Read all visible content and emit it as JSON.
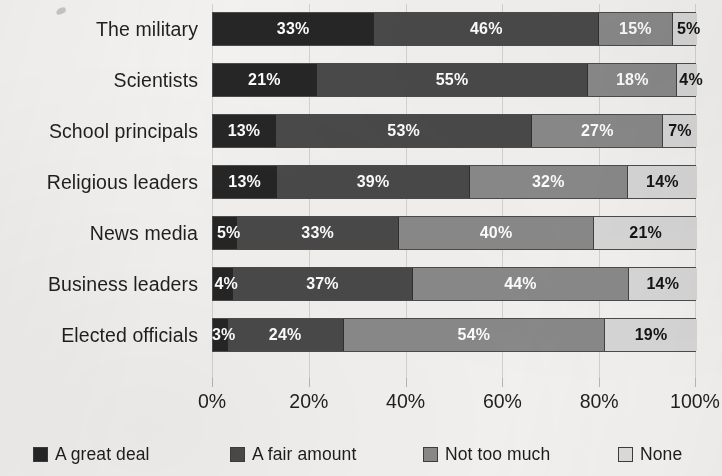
{
  "chart_data": {
    "type": "bar",
    "orientation": "horizontal",
    "stacked": true,
    "normalized_percent": true,
    "title": "",
    "subtitle": "",
    "xlabel": "",
    "ylabel": "",
    "xlim": [
      0,
      100
    ],
    "grid": true,
    "legend_position": "bottom",
    "categories": [
      "The military",
      "Scientists",
      "School principals",
      "Religious leaders",
      "News media",
      "Business leaders",
      "Elected officials"
    ],
    "series": [
      {
        "name": "A great deal",
        "color": "#262626",
        "values": [
          33,
          21,
          13,
          13,
          5,
          4,
          3
        ],
        "labels": [
          "33%",
          "21%",
          "13%",
          "13%",
          "5%",
          "4%",
          "3%"
        ]
      },
      {
        "name": "A fair amount",
        "color": "#4a4a4a",
        "values": [
          46,
          55,
          53,
          39,
          33,
          37,
          24
        ],
        "labels": [
          "46%",
          "55%",
          "53%",
          "39%",
          "33%",
          "37%",
          "24%"
        ]
      },
      {
        "name": "Not too much",
        "color": "#8a8a8a",
        "values": [
          15,
          18,
          27,
          32,
          40,
          44,
          54
        ],
        "labels": [
          "15%",
          "18%",
          "27%",
          "32%",
          "40%",
          "44%",
          "54%"
        ]
      },
      {
        "name": "None",
        "color": "#d8d8d8",
        "values": [
          5,
          4,
          7,
          14,
          21,
          14,
          19
        ],
        "labels": [
          "5%",
          "4%",
          "7%",
          "14%",
          "21%",
          "14%",
          "19%"
        ]
      }
    ],
    "xticks": [
      0,
      20,
      40,
      60,
      80,
      100
    ],
    "xticklabels": [
      "0%",
      "20%",
      "40%",
      "60%",
      "80%",
      "100%"
    ]
  },
  "axis": {
    "ticks": [
      {
        "value": 0,
        "label": "0%"
      },
      {
        "value": 20,
        "label": "20%"
      },
      {
        "value": 40,
        "label": "40%"
      },
      {
        "value": 60,
        "label": "60%"
      },
      {
        "value": 80,
        "label": "80%"
      },
      {
        "value": 100,
        "label": "100%"
      }
    ]
  },
  "legend": {
    "items": [
      {
        "label": "A great deal",
        "color": "#262626",
        "x": 33
      },
      {
        "label": "A fair amount",
        "color": "#4a4a4a",
        "x": 230
      },
      {
        "label": "Not too much",
        "color": "#8a8a8a",
        "x": 423
      },
      {
        "label": "None",
        "color": "#dedede",
        "x": 618
      }
    ]
  },
  "colors": {
    "background": "#f4f3f1",
    "bar_border": "#4c4c4c",
    "gridline": "#cfcdc9",
    "text": "#1f1f1f",
    "label_on_dark": "#ffffff",
    "label_on_light": "#141414"
  }
}
